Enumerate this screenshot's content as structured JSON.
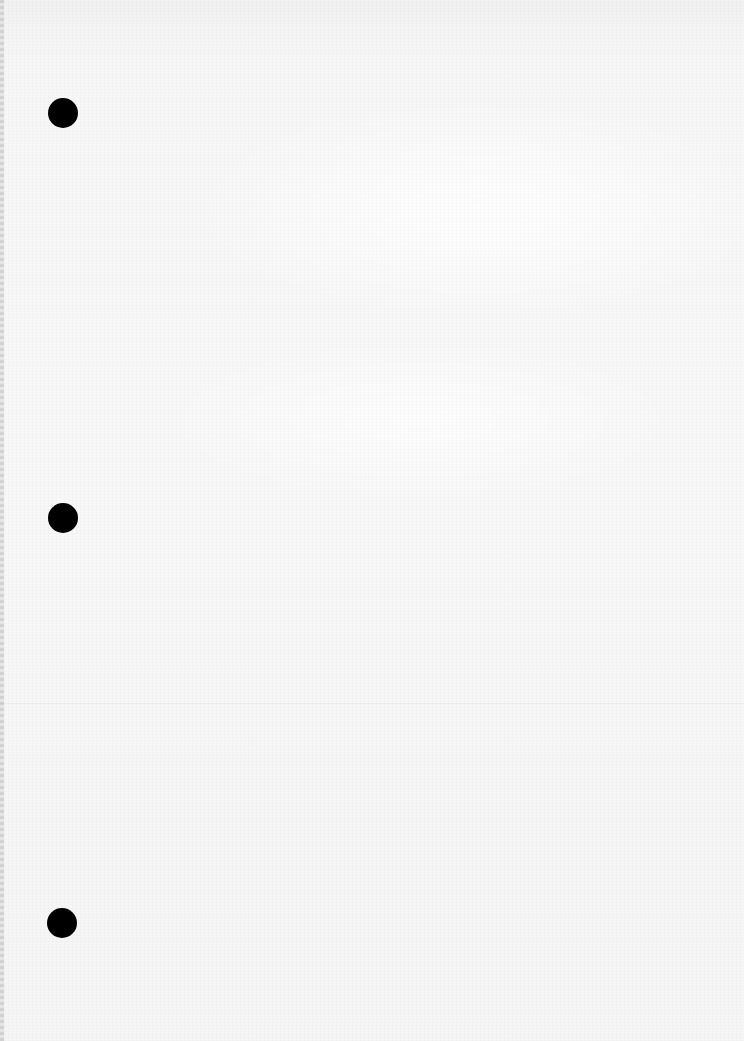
{
  "document": {
    "type": "blank-scanned-page",
    "text": "",
    "background_color": "#f6f6f6",
    "punch_hole_color": "#000000"
  },
  "punch_holes": [
    {
      "cx": 63,
      "cy": 113,
      "r": 15
    },
    {
      "cx": 63,
      "cy": 518,
      "r": 15
    },
    {
      "cx": 62,
      "cy": 923,
      "r": 15
    }
  ],
  "faint_lines": [
    {
      "y": 703
    }
  ]
}
